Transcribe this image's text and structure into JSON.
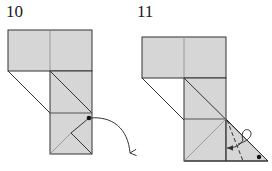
{
  "steps": [
    {
      "number": "10",
      "description": "Swivel the marked corner out and down",
      "marker": "dot",
      "arrow": "curved-fold-down"
    },
    {
      "number": "11",
      "description": "Valley-fold the flap along the dashed line and tuck it behind",
      "marker": "dot",
      "fold_line": "dashed",
      "arrow": "curved-tuck-left"
    }
  ],
  "colors": {
    "paper_fill": "#d6d6d6",
    "outline": "#333333",
    "crease": "#8a8a8a",
    "background": "#ffffff"
  }
}
